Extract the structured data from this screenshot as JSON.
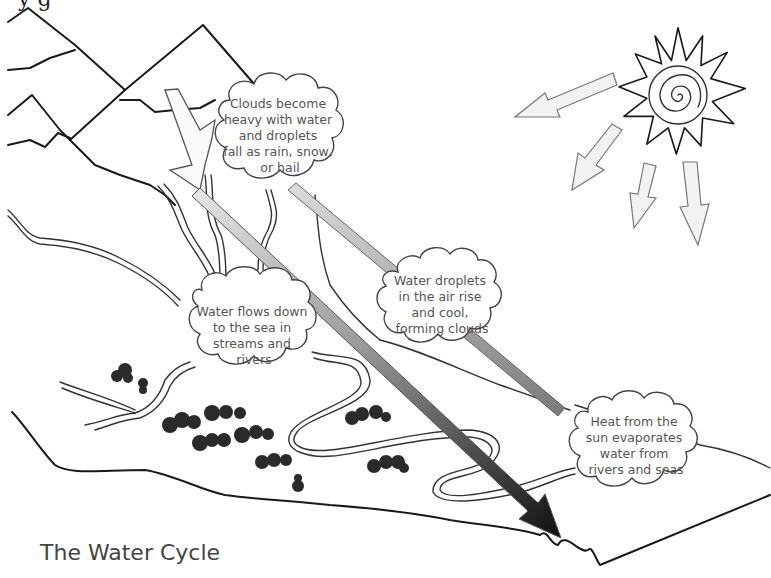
{
  "header": {
    "cropped_text_fragment": "y                                    g"
  },
  "diagram": {
    "title": "The Water Cycle",
    "labels": [
      {
        "id": "precipitation",
        "lines": [
          "Clouds become",
          "heavy with water",
          "and droplets",
          "fall as rain, snow,",
          "or hail"
        ]
      },
      {
        "id": "condensation",
        "lines": [
          "Water droplets",
          "in the air rise",
          "and cool,",
          "forming clouds"
        ]
      },
      {
        "id": "collection",
        "lines": [
          "Water flows down",
          "to the sea in",
          "streams and",
          "rivers"
        ]
      },
      {
        "id": "evaporation",
        "lines": [
          "Heat from the",
          "sun evaporates",
          "water from",
          "rivers and seas"
        ]
      }
    ],
    "icons": [
      "sun-icon",
      "sun-ray-arrow-icon",
      "mountain-icon",
      "river-icon",
      "tree-cluster-icon",
      "sea-icon",
      "cycle-arrow-icon"
    ],
    "colors": {
      "ink": "#1a1a1a",
      "cloud_text": "#555555",
      "arrow_light": "#d0d0d0",
      "arrow_mid": "#8a8a8a",
      "arrow_dark": "#1e1e1e",
      "background": "#ffffff"
    }
  }
}
